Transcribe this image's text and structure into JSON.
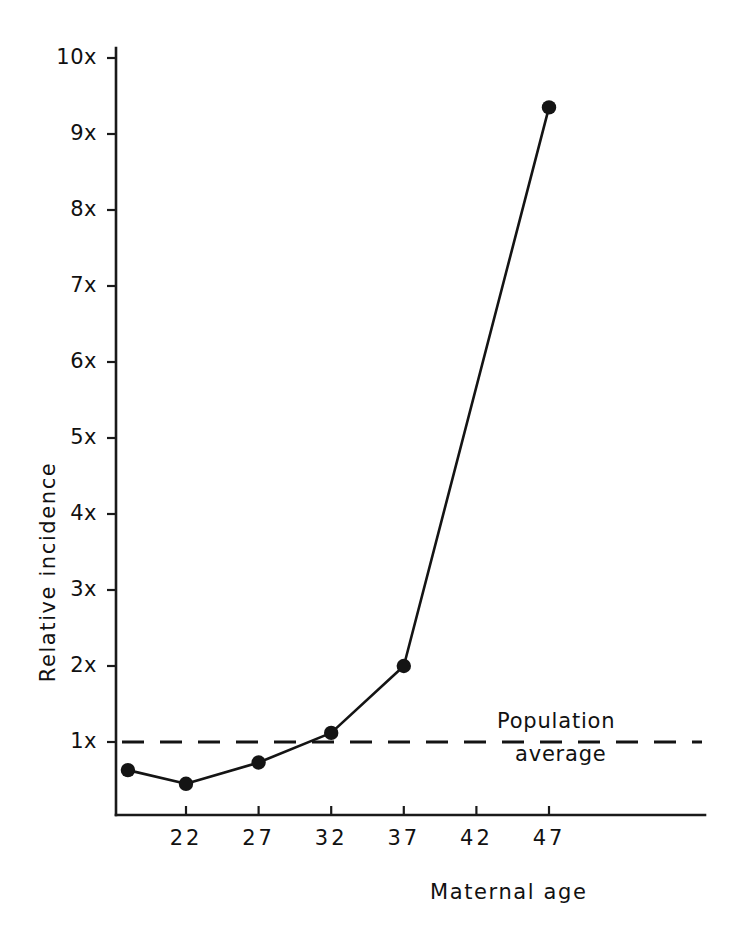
{
  "chart_data": {
    "type": "line",
    "title": "",
    "xlabel": "Maternal age",
    "ylabel": "Relative incidence",
    "x": [
      18,
      22,
      27,
      32,
      37,
      47
    ],
    "values": [
      0.63,
      0.45,
      0.73,
      1.12,
      2.0,
      9.35
    ],
    "series": [
      {
        "name": "Relative incidence",
        "values": [
          0.63,
          0.45,
          0.73,
          1.12,
          2.0,
          9.35
        ]
      }
    ],
    "xticks": [
      22,
      27,
      32,
      37,
      42,
      47
    ],
    "xtick_labels": [
      "22",
      "27",
      "32",
      "37",
      "42",
      "47"
    ],
    "yticks": [
      1,
      2,
      3,
      4,
      5,
      6,
      7,
      8,
      9,
      10
    ],
    "ytick_labels": [
      "1x",
      "2x",
      "3x",
      "4x",
      "5x",
      "6x",
      "7x",
      "8x",
      "9x",
      "10x"
    ],
    "xlim": [
      18,
      51
    ],
    "ylim": [
      0,
      10.4
    ],
    "grid": false,
    "legend": false,
    "reference_line": {
      "value": 1.0,
      "style": "dashed",
      "label_line_1": "Population",
      "label_line_2": "average"
    },
    "marker": "filled-circle",
    "line_color": "#141414"
  },
  "axis": {
    "y_title": "Relative  incidence",
    "x_title": "Maternal  age"
  },
  "annotation": {
    "population_average_line1": "Population",
    "population_average_line2": "average"
  },
  "colors": {
    "ink": "#141414",
    "background": "#ffffff"
  }
}
